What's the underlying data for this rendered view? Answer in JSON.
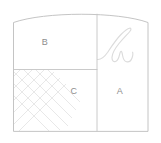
{
  "diagram": {
    "canvas": {
      "width": 161,
      "height": 143
    },
    "background_color": "#ffffff",
    "outline_color": "#bdbdbd",
    "divider_color": "#c4c4c4",
    "hatch_color": "#e2e2e2",
    "flourish_color": "#dcdcdc",
    "label_color": "#8d8d8d",
    "shape": {
      "name": "arched-rectangle",
      "left_x": 13,
      "right_x": 148,
      "bottom_y": 131,
      "shoulder_y": 22,
      "arc_apex_y": 11
    },
    "dividers": {
      "vertical_x": 97,
      "horizontal_y": 69,
      "horizontal_from_x": 13,
      "horizontal_to_x": 97
    },
    "regions": [
      {
        "id": "region-b",
        "label": "B",
        "label_x": 45,
        "label_y": 43,
        "fill": "none",
        "position": "top-left"
      },
      {
        "id": "region-a",
        "label": "A",
        "label_x": 120,
        "label_y": 92,
        "fill": "none",
        "position": "bottom-right"
      },
      {
        "id": "region-c",
        "label": "C",
        "label_x": 74,
        "label_y": 92,
        "fill": "lattice-hatch",
        "position": "bottom-left"
      }
    ],
    "ornaments": [
      {
        "id": "flourish",
        "name": "script-flourish",
        "description": "decorative cursive stroke",
        "bounds": {
          "x": 96,
          "y": 27,
          "width": 38,
          "height": 37
        }
      },
      {
        "id": "lattice",
        "name": "diamond-lattice-hatch",
        "description": "diagonal cross-hatch diamond pattern",
        "bounds": {
          "x": 14,
          "y": 71,
          "width": 52,
          "height": 52
        },
        "spacing": 11
      }
    ]
  }
}
